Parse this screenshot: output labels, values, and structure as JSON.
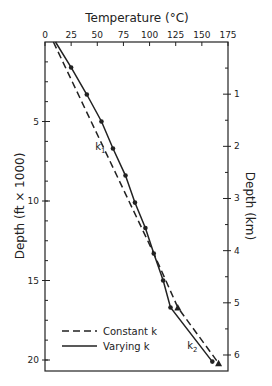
{
  "chart_data": {
    "type": "line",
    "title": "",
    "xlabel": "Temperature (°C)",
    "ylabel": "Depth (ft × 1000)",
    "ylabel_right": "Depth (km)",
    "xlim": [
      0,
      175
    ],
    "ylim": [
      0,
      20.5
    ],
    "x_axis_position": "top",
    "y_inverted": true,
    "grid": false,
    "x_ticks": [
      "0",
      "25",
      "50",
      "75",
      "100",
      "125",
      "150",
      "175"
    ],
    "y_ticks_left": [
      "5",
      "10",
      "15",
      "20"
    ],
    "y_ticks_right": [
      "1",
      "2",
      "3",
      "4",
      "5",
      "6"
    ],
    "legend": {
      "position": "lower left",
      "entries": [
        {
          "label": "Constant k",
          "style": "dashed"
        },
        {
          "label": "Varying k",
          "style": "solid"
        }
      ]
    },
    "annotations": [
      {
        "text": "k",
        "sub": "1",
        "temp": 48,
        "depth": 6.8
      },
      {
        "text": "k",
        "sub": "2",
        "temp": 136,
        "depth": 19.3
      }
    ],
    "series": [
      {
        "name": "Constant k",
        "style": "dashed",
        "marker": "triangle",
        "points": [
          {
            "temp": 8,
            "depth": 0
          },
          {
            "temp": 104,
            "depth": 13.3
          },
          {
            "temp": 127,
            "depth": 16.7,
            "marker": true
          },
          {
            "temp": 166,
            "depth": 20.2,
            "marker": true
          }
        ]
      },
      {
        "name": "Varying k",
        "style": "solid",
        "marker": "dot",
        "points": [
          {
            "temp": 10,
            "depth": 0
          },
          {
            "temp": 25,
            "depth": 1.6,
            "marker": true
          },
          {
            "temp": 40,
            "depth": 3.3,
            "marker": true
          },
          {
            "temp": 54,
            "depth": 5.0,
            "marker": true
          },
          {
            "temp": 65,
            "depth": 6.7,
            "marker": true
          },
          {
            "temp": 77,
            "depth": 8.4,
            "marker": true
          },
          {
            "temp": 86,
            "depth": 10.1,
            "marker": true
          },
          {
            "temp": 96,
            "depth": 11.7,
            "marker": true
          },
          {
            "temp": 104,
            "depth": 13.3,
            "marker": true
          },
          {
            "temp": 113,
            "depth": 15.0,
            "marker": true
          },
          {
            "temp": 120,
            "depth": 16.7,
            "marker": true
          },
          {
            "temp": 160,
            "depth": 20.1,
            "marker": true
          }
        ]
      }
    ]
  }
}
